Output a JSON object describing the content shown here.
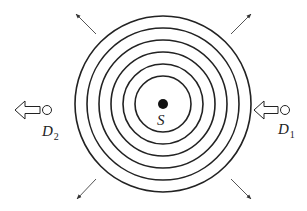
{
  "diagram": {
    "source": {
      "label": "S",
      "center": [
        163,
        104
      ],
      "dot_radius": 5
    },
    "wavefronts": {
      "count": 6,
      "radii": [
        28,
        40,
        52,
        64,
        76,
        88
      ],
      "stroke": "#222222"
    },
    "radial_arrows": [
      {
        "name": "top-left",
        "from": [
          96,
          34
        ],
        "to": [
          76,
          14
        ]
      },
      {
        "name": "top-right",
        "from": [
          231,
          34
        ],
        "to": [
          251,
          14
        ]
      },
      {
        "name": "bottom-left",
        "from": [
          96,
          179
        ],
        "to": [
          77,
          199
        ]
      },
      {
        "name": "bottom-right",
        "from": [
          231,
          179
        ],
        "to": [
          251,
          199
        ]
      }
    ],
    "detectors": [
      {
        "id": "D1",
        "label": "D",
        "subscript": "1",
        "side": "right",
        "circle": [
          285,
          110
        ],
        "arrow_tip_x": 254,
        "arrow_head_back_x": 264,
        "arrow_tail_x": 278,
        "label_pos": [
          278,
          134
        ]
      },
      {
        "id": "D2",
        "label": "D",
        "subscript": "2",
        "side": "left",
        "circle": [
          47,
          110
        ],
        "arrow_tip_x": 15,
        "arrow_head_back_x": 25,
        "arrow_tail_x": 40,
        "label_pos": [
          42,
          136
        ]
      }
    ],
    "colors": {
      "ink": "#222222",
      "arrow": "#555555",
      "background": "#ffffff"
    }
  }
}
